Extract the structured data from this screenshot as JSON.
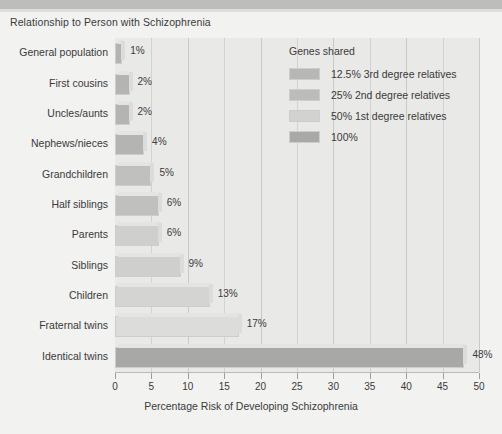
{
  "chart_data": {
    "type": "bar",
    "orientation": "horizontal",
    "title": "Relationship to Person with Schizophrenia",
    "xlabel": "Percentage Risk of Developing Schizophrenia",
    "ylabel": "",
    "xlim": [
      0,
      50
    ],
    "xticks": [
      0,
      5,
      10,
      15,
      20,
      25,
      30,
      35,
      40,
      45,
      50
    ],
    "xtick_labels": [
      "0",
      "5",
      "10",
      "15",
      "20",
      "25",
      "30",
      "35",
      "40",
      "45",
      "50"
    ],
    "grid": true,
    "grid_axis": "x",
    "legend_position": "upper-right-inside",
    "categories": [
      "General population",
      "First cousins",
      "Uncles/aunts",
      "Nephews/nieces",
      "Grandchildren",
      "Half siblings",
      "Parents",
      "Siblings",
      "Children",
      "Fraternal twins",
      "Identical twins"
    ],
    "values": [
      1,
      2,
      2,
      4,
      5,
      6,
      6,
      9,
      13,
      17,
      48
    ],
    "value_labels": [
      "1%",
      "2%",
      "2%",
      "4%",
      "5%",
      "6%",
      "6%",
      "9%",
      "13%",
      "17%",
      "48%"
    ],
    "group_by_point": [
      "12.5% 3rd degree relatives",
      "12.5% 3rd degree relatives",
      "25% 2nd degree relatives",
      "25% 2nd degree relatives",
      "25% 2nd degree relatives",
      "25% 2nd degree relatives",
      "50% 1st degree relatives",
      "50% 1st degree relatives",
      "50% 1st degree relatives",
      "50% 1st degree relatives",
      "100%"
    ],
    "bar_colors": [
      "#b4b4b2",
      "#b4b4b2",
      "#b4b4b2",
      "#b4b4b2",
      "#c0c0be",
      "#c0c0be",
      "#cfcfcd",
      "#cfcfcd",
      "#d4d4d2",
      "#dcdcda",
      "#a8a8a6"
    ],
    "series": [
      {
        "name": "Percentage Risk of Developing Schizophrenia",
        "values": [
          1,
          2,
          2,
          4,
          5,
          6,
          6,
          9,
          13,
          17,
          48
        ]
      }
    ]
  },
  "legend": {
    "title": "Genes shared",
    "entries": [
      {
        "label": "12.5% 3rd degree relatives",
        "color": "#b7b7b5"
      },
      {
        "label": "25% 2nd degree relatives",
        "color": "#bcbcba"
      },
      {
        "label": "50% 1st degree relatives",
        "color": "#d2d2d0"
      },
      {
        "label": "100%",
        "color": "#a9a9a7"
      }
    ]
  },
  "colors": {
    "page_background": "#f2f2f1",
    "plot_background": "#e9e9e7",
    "gridline": "#d2d2d0",
    "axis": "#b9b9b7",
    "text": "#3a3a3a",
    "top_band": "#bdbdbb"
  }
}
